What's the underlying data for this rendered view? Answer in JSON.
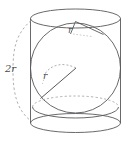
{
  "figure": {
    "background_color": "#ffffff",
    "stroke_color": "#58585a",
    "dashed_stroke_color": "#9a9a9c",
    "label_color": "#4a4a4a",
    "labels": {
      "radius_top": "r",
      "radius_sphere": "r",
      "height": "2r"
    },
    "shapes": {
      "cylinder": {
        "top_ellipse_center": [
          75.5,
          18.5
        ],
        "top_ellipse_radii": [
          45,
          9.5
        ],
        "bottom_ellipse_center": [
          75.5,
          123
        ],
        "bottom_ellipse_radii": [
          45,
          9.5
        ],
        "left_wall_x": 30.5,
        "right_wall_x": 120.5
      },
      "sphere": {
        "outline_circle_center": [
          75.5,
          68
        ],
        "outline_circle_radius": 45,
        "equator_ellipse_center": [
          75.5,
          107
        ],
        "equator_ellipse_radii": [
          43,
          11
        ]
      },
      "top_radius_segment": {
        "from": [
          75.5,
          22
        ],
        "to": [
          103,
          34
        ]
      },
      "sphere_radius_segment": {
        "from": [
          75.5,
          68
        ],
        "to": [
          41,
          98
        ]
      },
      "height_brace": {
        "from": [
          27,
          22
        ],
        "to": [
          27,
          118
        ]
      }
    }
  }
}
